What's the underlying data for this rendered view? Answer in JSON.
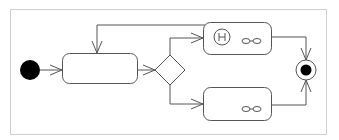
{
  "diagram": {
    "type": "uml-activity",
    "frame": {
      "x": 10,
      "y": 9,
      "w": 316,
      "h": 125,
      "stroke": "#d0d0d0"
    },
    "colors": {
      "stroke": "#555555",
      "fill": "#ffffff",
      "node_fill": "#000000"
    },
    "nodes": [
      {
        "id": "initial",
        "kind": "initial-node",
        "cx": 30,
        "cy": 70,
        "r": 10
      },
      {
        "id": "action-1",
        "kind": "action",
        "x": 62,
        "y": 53,
        "w": 75,
        "h": 30,
        "label": ""
      },
      {
        "id": "decision",
        "kind": "decision",
        "cx": 170,
        "cy": 70,
        "r": 15
      },
      {
        "id": "action-2",
        "kind": "action",
        "x": 203,
        "y": 24,
        "w": 68,
        "h": 30,
        "label": "",
        "icons": [
          "history-H",
          "subactivity-rake"
        ]
      },
      {
        "id": "action-3",
        "kind": "action",
        "x": 203,
        "y": 88,
        "w": 68,
        "h": 32,
        "label": "",
        "icons": [
          "subactivity-rake"
        ]
      },
      {
        "id": "final",
        "kind": "final-node",
        "cx": 306,
        "cy": 70,
        "r": 10
      }
    ],
    "edges": [
      {
        "from": "initial",
        "to": "action-1"
      },
      {
        "from": "action-1",
        "to": "decision"
      },
      {
        "from": "decision",
        "to": "action-2"
      },
      {
        "from": "decision",
        "to": "action-3"
      },
      {
        "from": "action-2",
        "to": "action-1",
        "label": "loop"
      },
      {
        "from": "action-2",
        "to": "final"
      },
      {
        "from": "action-3",
        "to": "final"
      }
    ]
  }
}
